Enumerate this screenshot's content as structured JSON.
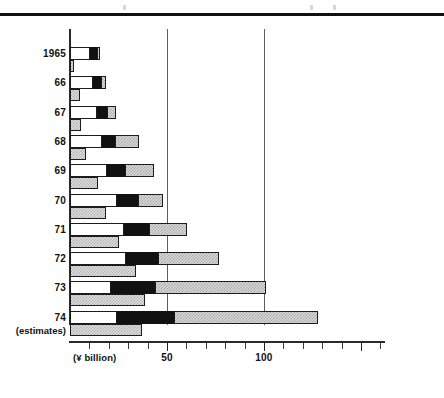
{
  "chart_data": {
    "type": "bar",
    "orientation": "horizontal",
    "title": "",
    "subtitle": "",
    "xlabel": "(¥ billion)",
    "ylabel": "",
    "xlim": [
      0,
      166
    ],
    "xticks": [
      0,
      10,
      20,
      30,
      40,
      50,
      60,
      70,
      80,
      90,
      100,
      110,
      120,
      130,
      140,
      150,
      160
    ],
    "xticklabels_shown": [
      "50",
      "100"
    ],
    "xticklabel_values": [
      50,
      100
    ],
    "gridlines": [
      50,
      100
    ],
    "grid": true,
    "legend": "none",
    "categories": [
      "1965",
      "66",
      "67",
      "68",
      "69",
      "70",
      "71",
      "72",
      "73",
      "74"
    ],
    "category_notes": [
      "",
      "",
      "",
      "",
      "",
      "",
      "",
      "",
      "",
      "(estimates)"
    ],
    "series": [
      {
        "name": "segment-1-white",
        "bar": "upper",
        "fill": "white",
        "values": [
          10.3,
          11.6,
          13.8,
          16.4,
          19.0,
          24.3,
          27.9,
          29.1,
          21.2,
          24.3
        ]
      },
      {
        "name": "segment-2-black",
        "bar": "upper",
        "fill": "black",
        "values": [
          3.7,
          4.2,
          5.3,
          6.9,
          9.5,
          10.6,
          12.7,
          16.4,
          22.8,
          29.1
        ]
      },
      {
        "name": "segment-3-hatched",
        "bar": "upper",
        "fill": "hatched",
        "values": [
          1.6,
          2.6,
          4.8,
          12.2,
          14.8,
          13.2,
          19.6,
          31.2,
          57.1,
          74.6
        ]
      },
      {
        "name": "lower-bar-hatched",
        "bar": "lower",
        "fill": "hatched",
        "values": [
          2.1,
          5.3,
          5.8,
          8.5,
          14.3,
          18.5,
          25.4,
          33.9,
          38.6,
          37.0
        ]
      }
    ],
    "upper_bar_totals": [
      15.6,
      18.4,
      23.9,
      35.5,
      43.3,
      48.1,
      60.2,
      76.7,
      101.1,
      128.0
    ],
    "colors": {
      "outline": "#1c1c1c",
      "white_fill": "#ffffff",
      "black_fill": "#111111",
      "hatched_fill": "#d9d9d9",
      "axis": "#2b2b2b",
      "gridline": "#5d5d5d"
    }
  },
  "axis": {
    "tick_labels": [
      {
        "value": 50,
        "text": "50"
      },
      {
        "value": 100,
        "text": "100"
      }
    ],
    "unit_label": "(¥ billion)"
  },
  "years": [
    {
      "label": "1965",
      "note": ""
    },
    {
      "label": "66",
      "note": ""
    },
    {
      "label": "67",
      "note": ""
    },
    {
      "label": "68",
      "note": ""
    },
    {
      "label": "69",
      "note": ""
    },
    {
      "label": "70",
      "note": ""
    },
    {
      "label": "71",
      "note": ""
    },
    {
      "label": "72",
      "note": ""
    },
    {
      "label": "73",
      "note": ""
    },
    {
      "label": "74",
      "note": "(estimates)"
    }
  ]
}
